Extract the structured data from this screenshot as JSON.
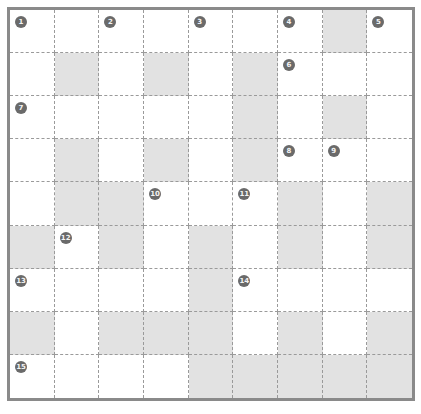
{
  "puzzle": {
    "type": "crossword",
    "rows": 9,
    "cols": 9,
    "colors": {
      "border": "#8a8a8a",
      "grid_line": "#9a9a9a",
      "shaded_cell": "#e2e2e2",
      "open_cell": "#ffffff",
      "number_badge": "#6a6a6a"
    },
    "shaded": [
      [
        0,
        7
      ],
      [
        1,
        1
      ],
      [
        1,
        3
      ],
      [
        1,
        5
      ],
      [
        2,
        5
      ],
      [
        2,
        7
      ],
      [
        3,
        1
      ],
      [
        3,
        3
      ],
      [
        3,
        5
      ],
      [
        4,
        1
      ],
      [
        4,
        2
      ],
      [
        4,
        6
      ],
      [
        4,
        8
      ],
      [
        5,
        0
      ],
      [
        5,
        2
      ],
      [
        5,
        4
      ],
      [
        5,
        6
      ],
      [
        5,
        8
      ],
      [
        6,
        4
      ],
      [
        7,
        0
      ],
      [
        7,
        2
      ],
      [
        7,
        3
      ],
      [
        7,
        4
      ],
      [
        7,
        6
      ],
      [
        7,
        8
      ],
      [
        8,
        4
      ],
      [
        8,
        5
      ],
      [
        8,
        6
      ],
      [
        8,
        7
      ],
      [
        8,
        8
      ]
    ],
    "numbers": [
      {
        "n": "1",
        "row": 0,
        "col": 0
      },
      {
        "n": "2",
        "row": 0,
        "col": 2
      },
      {
        "n": "3",
        "row": 0,
        "col": 4
      },
      {
        "n": "4",
        "row": 0,
        "col": 6
      },
      {
        "n": "5",
        "row": 0,
        "col": 8
      },
      {
        "n": "6",
        "row": 1,
        "col": 6
      },
      {
        "n": "7",
        "row": 2,
        "col": 0
      },
      {
        "n": "8",
        "row": 3,
        "col": 6
      },
      {
        "n": "9",
        "row": 3,
        "col": 7
      },
      {
        "n": "10",
        "row": 4,
        "col": 3
      },
      {
        "n": "11",
        "row": 4,
        "col": 5
      },
      {
        "n": "12",
        "row": 5,
        "col": 1
      },
      {
        "n": "13",
        "row": 6,
        "col": 0
      },
      {
        "n": "14",
        "row": 6,
        "col": 5
      },
      {
        "n": "15",
        "row": 8,
        "col": 0
      }
    ]
  }
}
